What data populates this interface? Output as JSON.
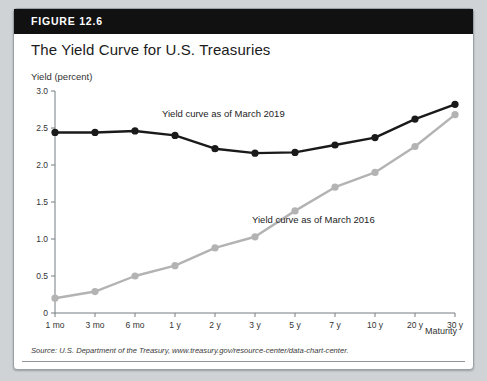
{
  "figure": {
    "label": "FIGURE 12.6",
    "title": "The Yield Curve for U.S. Treasuries",
    "source": "Source: U.S. Department of the Treasury, www.treasury.gov/resource-center/data-chart-center."
  },
  "colors": {
    "header_bg": "#111111",
    "card_bg": "#ffffff",
    "page_bg": "#cfd3d6",
    "series_2019": "#1a1a1a",
    "series_2016": "#b3b3b3",
    "axis": "#777d80"
  },
  "annotations": {
    "series_2019_label": "Yield curve as of March 2019",
    "series_2016_label": "Yield curve as of March 2016"
  },
  "chart_data": {
    "type": "line",
    "title": "The Yield Curve for U.S. Treasuries",
    "xlabel": "Maturity",
    "ylabel": "Yield (percent)",
    "categories": [
      "1 mo",
      "3 mo",
      "6 mo",
      "1 y",
      "2 y",
      "3 y",
      "5 y",
      "7 y",
      "10 y",
      "20 y",
      "30 y"
    ],
    "ylim": [
      0,
      3.0
    ],
    "yticks": [
      "0",
      "0.5",
      "1.0",
      "1.5",
      "2.0",
      "2.5",
      "3.0"
    ],
    "ytick_values": [
      0,
      0.5,
      1.0,
      1.5,
      2.0,
      2.5,
      3.0
    ],
    "grid": false,
    "legend_position": "inline-annotation",
    "series": [
      {
        "name": "Yield curve as of March 2019",
        "color": "#1a1a1a",
        "values": [
          2.44,
          2.44,
          2.46,
          2.4,
          2.22,
          2.16,
          2.17,
          2.27,
          2.37,
          2.62,
          2.82
        ]
      },
      {
        "name": "Yield curve as of March 2016",
        "color": "#b3b3b3",
        "values": [
          0.2,
          0.29,
          0.5,
          0.64,
          0.88,
          1.03,
          1.38,
          1.7,
          1.9,
          2.25,
          2.68
        ]
      }
    ]
  }
}
